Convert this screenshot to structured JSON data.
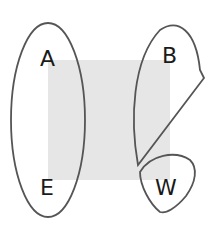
{
  "diagram": {
    "background_square": {
      "color": "#e6e6e6"
    },
    "outline_color": "#555555",
    "labels": {
      "a": "A",
      "e": "E",
      "b": "B",
      "w": "W"
    }
  }
}
